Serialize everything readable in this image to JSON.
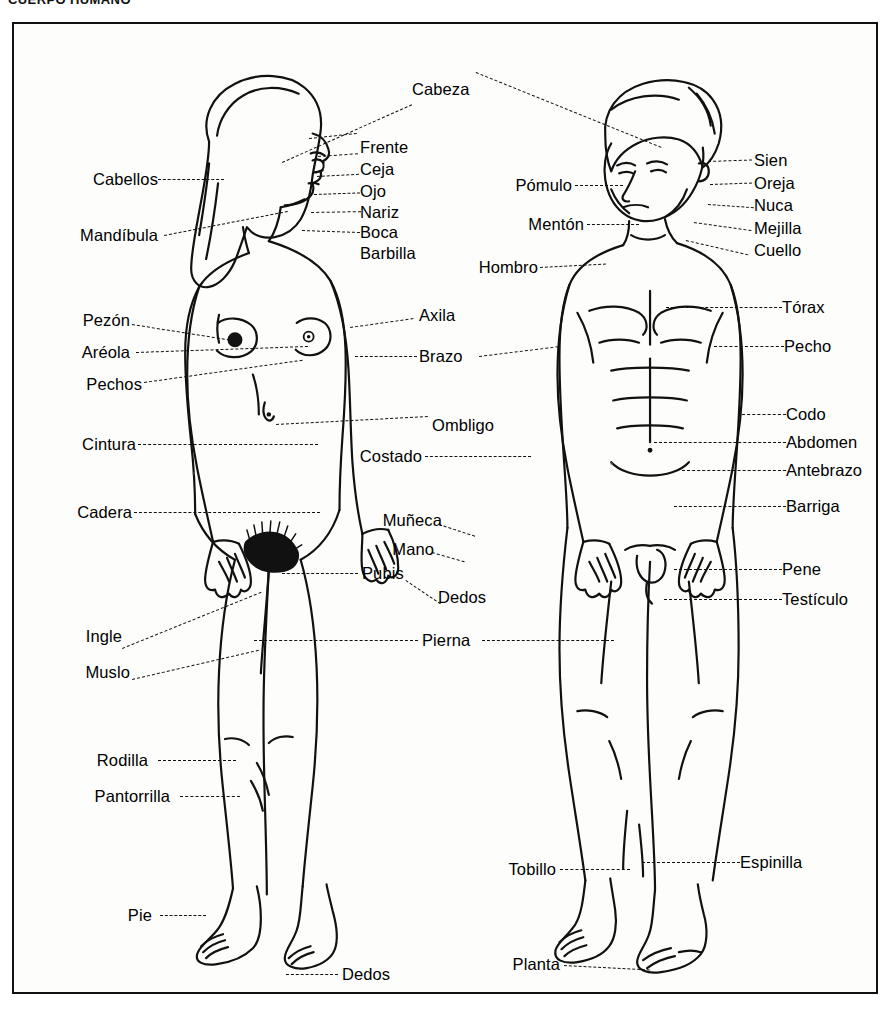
{
  "page": {
    "title": "CUERPO HUMANO",
    "language": "es",
    "diagram_type": "anatomical-labelled-illustration",
    "subjects": [
      "female-body-front",
      "male-body-front"
    ]
  },
  "shared_labels": [
    {
      "name": "cabeza",
      "text": "Cabeza"
    }
  ],
  "female_labels": {
    "head": [
      {
        "name": "frente",
        "text": "Frente"
      },
      {
        "name": "ceja",
        "text": "Ceja"
      },
      {
        "name": "ojo",
        "text": "Ojo"
      },
      {
        "name": "nariz",
        "text": "Nariz"
      },
      {
        "name": "boca",
        "text": "Boca"
      },
      {
        "name": "barbilla",
        "text": "Barbilla"
      }
    ],
    "left_side": [
      {
        "name": "cabellos",
        "text": "Cabellos"
      },
      {
        "name": "mandibula",
        "text": "Mandíbula"
      },
      {
        "name": "pezon",
        "text": "Pezón"
      },
      {
        "name": "areola",
        "text": "Aréola"
      },
      {
        "name": "pechos",
        "text": "Pechos"
      },
      {
        "name": "cintura",
        "text": "Cintura"
      },
      {
        "name": "cadera",
        "text": "Cadera"
      },
      {
        "name": "ingle",
        "text": "Ingle"
      },
      {
        "name": "muslo",
        "text": "Muslo"
      },
      {
        "name": "rodilla",
        "text": "Rodilla"
      },
      {
        "name": "pantorrilla",
        "text": "Pantorrilla"
      },
      {
        "name": "pie",
        "text": "Pie"
      }
    ],
    "right_side": [
      {
        "name": "axila",
        "text": "Axila"
      },
      {
        "name": "brazo",
        "text": "Brazo"
      },
      {
        "name": "ombligo",
        "text": "Ombligo"
      },
      {
        "name": "costado",
        "text": "Costado"
      },
      {
        "name": "muneca",
        "text": "Muñeca"
      },
      {
        "name": "mano",
        "text": "Mano"
      },
      {
        "name": "pubis",
        "text": "Pubis"
      },
      {
        "name": "dedos-mano",
        "text": "Dedos"
      },
      {
        "name": "pierna",
        "text": "Pierna"
      },
      {
        "name": "dedos-pie",
        "text": "Dedos"
      }
    ]
  },
  "male_labels": {
    "left_side": [
      {
        "name": "pomulo",
        "text": "Pómulo"
      },
      {
        "name": "menton",
        "text": "Mentón"
      },
      {
        "name": "hombro",
        "text": "Hombro"
      },
      {
        "name": "tobillo",
        "text": "Tobillo"
      },
      {
        "name": "planta",
        "text": "Planta"
      }
    ],
    "right_side": [
      {
        "name": "sien",
        "text": "Sien"
      },
      {
        "name": "oreja",
        "text": "Oreja"
      },
      {
        "name": "nuca",
        "text": "Nuca"
      },
      {
        "name": "mejilla",
        "text": "Mejilla"
      },
      {
        "name": "cuello",
        "text": "Cuello"
      },
      {
        "name": "torax",
        "text": "Tórax"
      },
      {
        "name": "pecho",
        "text": "Pecho"
      },
      {
        "name": "codo",
        "text": "Codo"
      },
      {
        "name": "abdomen",
        "text": "Abdomen"
      },
      {
        "name": "antebrazo",
        "text": "Antebrazo"
      },
      {
        "name": "barriga",
        "text": "Barriga"
      },
      {
        "name": "pene",
        "text": "Pene"
      },
      {
        "name": "testiculo",
        "text": "Testículo"
      },
      {
        "name": "espinilla",
        "text": "Espinilla"
      }
    ]
  },
  "colors": {
    "ink": "#111111",
    "paper": "#fdfdfc",
    "leader": "#111111"
  }
}
